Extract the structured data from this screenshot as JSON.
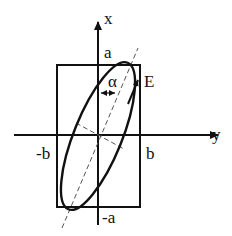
{
  "diagram": {
    "type": "polarization-ellipse",
    "colors": {
      "stroke": "#111111",
      "background": "#ffffff"
    },
    "axes": {
      "vertical_label": "x",
      "horizontal_label": "y"
    },
    "box_labels": {
      "top": "a",
      "bottom": "-a",
      "left": "-b",
      "right": "b"
    },
    "field_label": "E",
    "angle_label": "α"
  }
}
